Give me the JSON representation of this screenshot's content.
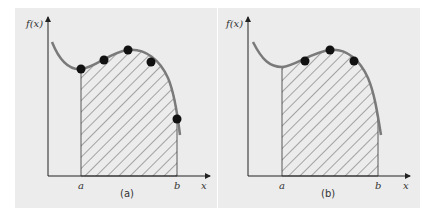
{
  "figure": {
    "panels": [
      {
        "id": "a",
        "caption": "(a)",
        "y_axis_label": "f(x)",
        "x_axis_label": "x",
        "lower_limit_label": "a",
        "upper_limit_label": "b",
        "points_count": 5
      },
      {
        "id": "b",
        "caption": "(b)",
        "y_axis_label": "f(x)",
        "x_axis_label": "x",
        "lower_limit_label": "a",
        "upper_limit_label": "b",
        "points_count": 3
      }
    ],
    "colors": {
      "panel_bg": "#ececec",
      "curve": "#7a7a7a",
      "points": "#111111",
      "hatch": "#333333",
      "axes": "#333333"
    }
  }
}
